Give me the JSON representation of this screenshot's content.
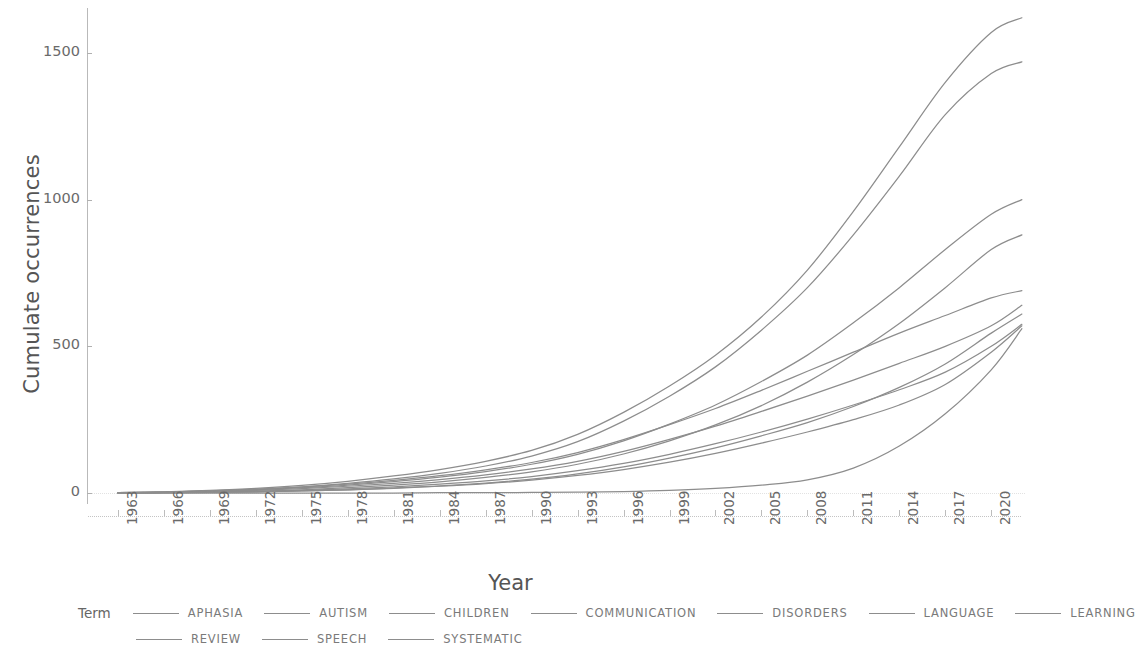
{
  "chart_data": {
    "type": "line",
    "title": "",
    "xlabel": "Year",
    "ylabel": "Cumulate occurrences",
    "xlim": [
      1963,
      2022
    ],
    "ylim": [
      0,
      1620
    ],
    "y_ticks": [
      0,
      500,
      1000,
      1500
    ],
    "y_tick_labels": [
      "0",
      "500",
      "1000",
      "1500"
    ],
    "x_ticks": [
      1963,
      1966,
      1969,
      1972,
      1975,
      1978,
      1981,
      1984,
      1987,
      1990,
      1993,
      1996,
      1999,
      2002,
      2005,
      2008,
      2011,
      2014,
      2017,
      2020
    ],
    "x_tick_labels": [
      "1963",
      "1966",
      "1969",
      "1972",
      "1975",
      "1978",
      "1981",
      "1984",
      "1987",
      "1990",
      "1993",
      "1996",
      "1999",
      "2002",
      "2005",
      "2008",
      "2011",
      "2014",
      "2017",
      "2020"
    ],
    "grid": "horizontal-dotted",
    "legend_position": "bottom",
    "legend_title": "Term",
    "line_color": "#8d8d8d",
    "axis_color": "#b9b9b9",
    "text_color": "#6a6a6a",
    "x_values": [
      1963,
      1966,
      1969,
      1972,
      1975,
      1978,
      1981,
      1984,
      1987,
      1990,
      1993,
      1996,
      1999,
      2002,
      2005,
      2008,
      2011,
      2014,
      2017,
      2020,
      2022
    ],
    "series": [
      {
        "name": "LANGUAGE",
        "values": [
          1,
          4,
          9,
          16,
          26,
          40,
          58,
          80,
          108,
          145,
          200,
          275,
          365,
          470,
          600,
          760,
          960,
          1180,
          1400,
          1570,
          1620
        ]
      },
      {
        "name": "DISORDERS",
        "values": [
          1,
          3,
          7,
          13,
          21,
          33,
          48,
          67,
          92,
          126,
          175,
          245,
          330,
          430,
          555,
          700,
          880,
          1080,
          1290,
          1430,
          1470
        ]
      },
      {
        "name": "CHILDREN",
        "values": [
          1,
          3,
          6,
          11,
          18,
          27,
          39,
          54,
          73,
          98,
          132,
          178,
          235,
          300,
          380,
          470,
          580,
          700,
          830,
          950,
          1000
        ]
      },
      {
        "name": "COMMUNICATION",
        "values": [
          0,
          1,
          3,
          6,
          11,
          18,
          27,
          38,
          53,
          72,
          98,
          133,
          178,
          232,
          298,
          378,
          472,
          578,
          700,
          830,
          880
        ]
      },
      {
        "name": "SPEECH",
        "values": [
          1,
          3,
          7,
          12,
          20,
          30,
          43,
          59,
          79,
          104,
          138,
          182,
          233,
          288,
          350,
          415,
          480,
          545,
          605,
          665,
          690
        ]
      },
      {
        "name": "APHASIA",
        "values": [
          1,
          2,
          5,
          9,
          15,
          23,
          33,
          46,
          62,
          82,
          108,
          142,
          183,
          228,
          278,
          330,
          385,
          442,
          500,
          570,
          640
        ]
      },
      {
        "name": "AUTISM",
        "values": [
          0,
          1,
          2,
          4,
          7,
          11,
          17,
          24,
          34,
          47,
          65,
          89,
          119,
          154,
          195,
          240,
          295,
          360,
          440,
          545,
          610
        ]
      },
      {
        "name": "LEARNING",
        "values": [
          0,
          1,
          3,
          5,
          9,
          14,
          21,
          30,
          41,
          56,
          76,
          101,
          132,
          168,
          208,
          252,
          300,
          352,
          412,
          500,
          575
        ]
      },
      {
        "name": "REVIEW",
        "values": [
          0,
          1,
          2,
          4,
          7,
          11,
          16,
          23,
          32,
          44,
          60,
          80,
          105,
          135,
          170,
          208,
          250,
          300,
          370,
          480,
          570
        ]
      },
      {
        "name": "SYSTEMATIC",
        "values": [
          0,
          0,
          0,
          0,
          0,
          0,
          0,
          1,
          1,
          2,
          3,
          5,
          9,
          16,
          27,
          45,
          85,
          160,
          270,
          420,
          560
        ]
      }
    ]
  },
  "legend": {
    "title": "Term",
    "row1": [
      "APHASIA",
      "AUTISM",
      "CHILDREN",
      "COMMUNICATION",
      "DISORDERS",
      "LANGUAGE",
      "LEARNING"
    ],
    "row2": [
      "REVIEW",
      "SPEECH",
      "SYSTEMATIC"
    ]
  }
}
